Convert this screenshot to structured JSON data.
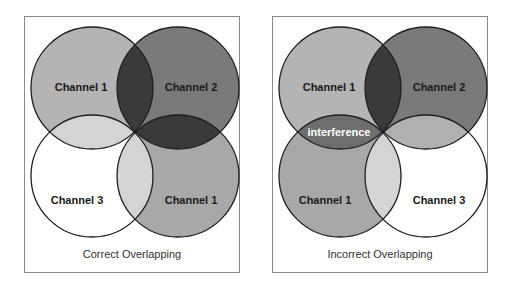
{
  "panels": [
    {
      "caption": "Correct Overlapping",
      "circles": [
        {
          "label": "Channel 1",
          "position": "top-left",
          "fill": "#b4b4b4"
        },
        {
          "label": "Channel 2",
          "position": "top-right",
          "fill": "#7a7a7a"
        },
        {
          "label": "Channel 3",
          "position": "bottom-left",
          "fill": "#ffffff"
        },
        {
          "label": "Channel 1",
          "position": "bottom-right",
          "fill": "#a8a8a8"
        }
      ]
    },
    {
      "caption": "Incorrect Overlapping",
      "circles": [
        {
          "label": "Channel 1",
          "position": "top-left",
          "fill": "#b4b4b4"
        },
        {
          "label": "Channel 2",
          "position": "top-right",
          "fill": "#7a7a7a"
        },
        {
          "label": "Channel 1",
          "position": "bottom-left",
          "fill": "#a8a8a8"
        },
        {
          "label": "Channel 3",
          "position": "bottom-right",
          "fill": "#ffffff"
        }
      ],
      "overlap_label": "interference"
    }
  ],
  "colors": {
    "stroke": "#1e1e1e",
    "dark_overlap": "#3a3a3a",
    "light_overlap": "#d4d4d4",
    "interference_overlap": "#6e6e6e"
  }
}
